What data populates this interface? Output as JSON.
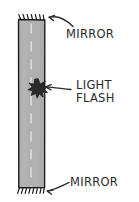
{
  "figure": {
    "background_color": "#ffffff",
    "width": 139,
    "height": 202
  },
  "colors": {
    "background": "#ffffff",
    "bar_fill": "#b0b0b0",
    "bar_fill_light": "#bdbdbd",
    "bar_outline": "#1c1c1c",
    "ink": "#2b2b2b",
    "starburst": "#2a2a2a",
    "dashed_line": "#d8d8d8"
  },
  "labels": {
    "mirror_top": "MIRROR",
    "light_flash_line1": "LIGHT",
    "light_flash_line2": "FLASH",
    "mirror_bottom": "MIRROR"
  },
  "elements": {
    "bar": {
      "name": "light-path-column",
      "x": 18,
      "y": 19,
      "width": 27,
      "height": 169
    },
    "mirror_top_surface": {
      "name": "top-mirror-surface",
      "y": 19,
      "hatch_count": 7
    },
    "mirror_bottom_surface": {
      "name": "bottom-mirror-surface",
      "y": 188,
      "hatch_count": 8
    },
    "starburst": {
      "name": "light-flash-starburst",
      "cx": 38,
      "cy": 88,
      "points": 11,
      "outer_radius": 9,
      "inner_radius": 4
    },
    "center_dashes": {
      "name": "center-dashed-axis",
      "x": 31,
      "y_start": 24,
      "y_end": 185,
      "dash_length": 9,
      "gap_length": 9
    }
  },
  "annotations": {
    "arrow_top": {
      "name": "mirror-top-pointer-arrow",
      "from_x": 72,
      "from_y": 25,
      "to_x": 48,
      "to_y": 18
    },
    "arrow_flash": {
      "name": "light-flash-pointer-arrow",
      "from_x": 70,
      "from_y": 88,
      "to_x": 45,
      "to_y": 87
    },
    "arrow_bottom": {
      "name": "mirror-bottom-pointer-arrow",
      "from_x": 68,
      "from_y": 183,
      "to_x": 47,
      "to_y": 191
    }
  }
}
